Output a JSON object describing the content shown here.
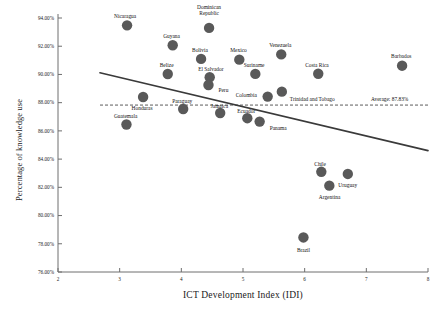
{
  "chart_data": {
    "type": "scatter",
    "title": "",
    "xlabel": "ICT Development Index (IDI)",
    "ylabel": "Percentage of knowledge use",
    "xlim": [
      2,
      8
    ],
    "ylim": [
      76,
      94
    ],
    "xticks": [
      "2",
      "3",
      "4",
      "5",
      "6",
      "7",
      "8"
    ],
    "yticks": [
      "76.00%",
      "78.00%",
      "80.00%",
      "82.00%",
      "84.00%",
      "86.00%",
      "88.00%",
      "90.00%",
      "92.00%",
      "94.00%"
    ],
    "grid": false,
    "legend": null,
    "marker_color": "#595959",
    "trend_color": "#3a3a3a",
    "average_value": 87.83,
    "average_annotation": "Average: 87.83%",
    "trendline": {
      "x0": 2.68,
      "y0": 90.12,
      "x1": 8.0,
      "y1": 84.6
    },
    "points": [
      {
        "label": "Nicaragua",
        "x": 3.12,
        "y": 93.48,
        "lx": -2,
        "ly": -9,
        "align": "center"
      },
      {
        "label": "Dominican Republic",
        "x": 4.45,
        "y": 93.3,
        "lx": 0,
        "ly": -15,
        "align": "center"
      },
      {
        "label": "Guyana",
        "x": 3.86,
        "y": 92.07,
        "lx": -1,
        "ly": -9,
        "align": "center"
      },
      {
        "label": "Bolivia",
        "x": 4.32,
        "y": 91.1,
        "lx": -1,
        "ly": -9,
        "align": "center"
      },
      {
        "label": "Mexico",
        "x": 4.94,
        "y": 91.05,
        "lx": -1,
        "ly": -9,
        "align": "center"
      },
      {
        "label": "Venezuela",
        "x": 5.62,
        "y": 91.42,
        "lx": -1,
        "ly": -9,
        "align": "center"
      },
      {
        "label": "Barbados",
        "x": 7.58,
        "y": 90.62,
        "lx": -1,
        "ly": -9,
        "align": "center"
      },
      {
        "label": "Belize",
        "x": 3.78,
        "y": 90.03,
        "lx": -1,
        "ly": -9,
        "align": "center"
      },
      {
        "label": "El Salvador",
        "x": 4.46,
        "y": 89.8,
        "lx": 1,
        "ly": -8,
        "align": "center"
      },
      {
        "label": "Suriname",
        "x": 5.2,
        "y": 90.04,
        "lx": -1,
        "ly": -9,
        "align": "center"
      },
      {
        "label": "Costa Rica",
        "x": 6.22,
        "y": 90.05,
        "lx": -1,
        "ly": -9,
        "align": "center"
      },
      {
        "label": "Peru",
        "x": 4.44,
        "y": 89.25,
        "lx": 10,
        "ly": 1,
        "align": "left"
      },
      {
        "label": "Honduras",
        "x": 3.38,
        "y": 88.4,
        "lx": -1,
        "ly": 7,
        "align": "center"
      },
      {
        "label": "Colombia",
        "x": 5.4,
        "y": 88.43,
        "lx": -11,
        "ly": -1,
        "align": "right"
      },
      {
        "label": "Trinidad and Tobago",
        "x": 5.63,
        "y": 88.78,
        "lx": 8,
        "ly": 3,
        "align": "left"
      },
      {
        "label": "Paraguay",
        "x": 4.03,
        "y": 87.55,
        "lx": -1,
        "ly": -8,
        "align": "center"
      },
      {
        "label": "Jamaica",
        "x": 4.63,
        "y": 87.27,
        "lx": -1,
        "ly": -7,
        "align": "center"
      },
      {
        "label": "Ecuador",
        "x": 5.07,
        "y": 86.9,
        "lx": -1,
        "ly": -7,
        "align": "center"
      },
      {
        "label": "Panama",
        "x": 5.27,
        "y": 86.66,
        "lx": 10,
        "ly": 2,
        "align": "left"
      },
      {
        "label": "Guatemala",
        "x": 3.11,
        "y": 86.45,
        "lx": -1,
        "ly": -8,
        "align": "center"
      },
      {
        "label": "Chile",
        "x": 6.27,
        "y": 83.1,
        "lx": -1,
        "ly": -8,
        "align": "center"
      },
      {
        "label": "Uruguay",
        "x": 6.7,
        "y": 82.95,
        "lx": 0,
        "ly": 7,
        "align": "center"
      },
      {
        "label": "Argentina",
        "x": 6.4,
        "y": 82.12,
        "lx": 0,
        "ly": 7,
        "align": "center"
      },
      {
        "label": "Brazil",
        "x": 5.98,
        "y": 78.45,
        "lx": 0,
        "ly": 8,
        "align": "center"
      }
    ]
  }
}
